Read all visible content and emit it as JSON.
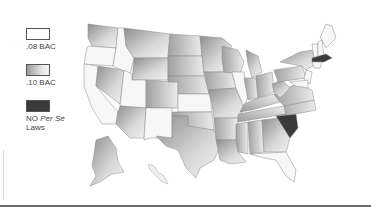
{
  "legend": {
    "items": [
      {
        "key": "bac08",
        "label": ".08 BAC",
        "fill": "#ffffff"
      },
      {
        "key": "bac10",
        "label": ".10 BAC",
        "fill": "gradient-gray"
      },
      {
        "key": "none",
        "label_prefix": "NO ",
        "label_italic": "Per Se",
        "label_suffix": "Laws",
        "fill": "#3a3a3a"
      }
    ]
  },
  "map": {
    "title": "",
    "colors": {
      "bac08": "#f7f7f7",
      "bac10_dark": "#9c9c9c",
      "bac10_light": "#eeeeee",
      "none": "#3a3a3a",
      "border": "#8a8a8a"
    },
    "states_no_per_se": [
      "South Carolina",
      "Massachusetts"
    ]
  }
}
